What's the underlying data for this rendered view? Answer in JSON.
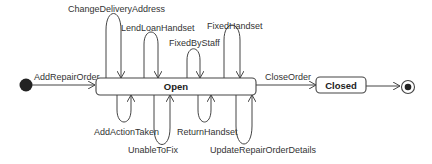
{
  "diagram": {
    "type": "uml-state-machine",
    "colors": {
      "stroke": "#444444",
      "text": "#333333",
      "fill": "#ffffff",
      "initial": "#222222"
    },
    "states": [
      {
        "id": "initial",
        "kind": "initial"
      },
      {
        "id": "open",
        "kind": "state",
        "label": "Open"
      },
      {
        "id": "closed",
        "kind": "state",
        "label": "Closed"
      },
      {
        "id": "final",
        "kind": "final"
      }
    ],
    "transitions": [
      {
        "from": "initial",
        "to": "open",
        "label": "AddRepairOrder"
      },
      {
        "from": "open",
        "to": "open",
        "label": "ChangeDeliveryAddress",
        "side": "top"
      },
      {
        "from": "open",
        "to": "open",
        "label": "LendLoanHandset",
        "side": "top"
      },
      {
        "from": "open",
        "to": "open",
        "label": "FixedByStaff",
        "side": "top"
      },
      {
        "from": "open",
        "to": "open",
        "label": "FixedHandset",
        "side": "top"
      },
      {
        "from": "open",
        "to": "open",
        "label": "AddActionTaken",
        "side": "bottom"
      },
      {
        "from": "open",
        "to": "open",
        "label": "UnableToFix",
        "side": "bottom"
      },
      {
        "from": "open",
        "to": "open",
        "label": "ReturnHandset",
        "side": "bottom"
      },
      {
        "from": "open",
        "to": "open",
        "label": "UpdateRepairOrderDetails",
        "side": "bottom"
      },
      {
        "from": "open",
        "to": "closed",
        "label": "CloseOrder"
      },
      {
        "from": "closed",
        "to": "final",
        "label": ""
      }
    ]
  }
}
